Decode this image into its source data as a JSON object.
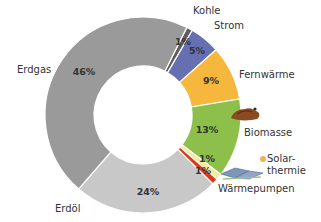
{
  "chart_data": {
    "type": "pie",
    "subtype": "donut",
    "title": "",
    "start_angle_deg": 26.6,
    "center": [
      143,
      115
    ],
    "outer_radius": 98,
    "inner_radius": 49,
    "legend_position": "none (direct labels)",
    "slices": [
      {
        "name": "Kohle",
        "value": 1,
        "label": "1%",
        "color": "#5e5e5e",
        "name_pos": [
          193,
          14
        ],
        "pct_pos": [
          183,
          45
        ]
      },
      {
        "name": "Strom",
        "value": 5,
        "label": "5%",
        "color": "#6670b0",
        "name_pos": [
          214,
          29
        ],
        "pct_pos": [
          197,
          54
        ]
      },
      {
        "name": "Fernwärme",
        "value": 9,
        "label": "9%",
        "color": "#f5b83d",
        "name_pos": [
          239,
          78
        ],
        "pct_pos": [
          211,
          84
        ]
      },
      {
        "name": "Biomasse",
        "value": 13,
        "label": "13%",
        "color": "#8cc04a",
        "name_pos": [
          244,
          136
        ],
        "pct_pos": [
          207,
          133
        ]
      },
      {
        "name": "Solar-\nthermie",
        "value": 1,
        "label": "1%",
        "color": "#f0ea9a",
        "name_pos": [
          267,
          162
        ],
        "pct_pos": [
          207,
          162
        ]
      },
      {
        "name": "Wärmepumpen",
        "value": 1,
        "label": "1%",
        "color": "#d93a1a",
        "name_pos": [
          218,
          192
        ],
        "pct_pos": [
          203,
          174
        ]
      },
      {
        "name": "Erdöl",
        "value": 24,
        "label": "24%",
        "color": "#c8c8c8",
        "name_pos": [
          55,
          212
        ],
        "pct_pos": [
          148,
          195
        ]
      },
      {
        "name": "Erdgas",
        "value": 46,
        "label": "46%",
        "color": "#9a9a9a",
        "name_pos": [
          17,
          73
        ],
        "pct_pos": [
          84,
          75
        ]
      }
    ],
    "decorations": [
      {
        "type": "biomass-pile-icon",
        "pos": [
          245,
          113
        ]
      },
      {
        "type": "solar-panel-icon",
        "pos": [
          237,
          172
        ]
      }
    ]
  }
}
